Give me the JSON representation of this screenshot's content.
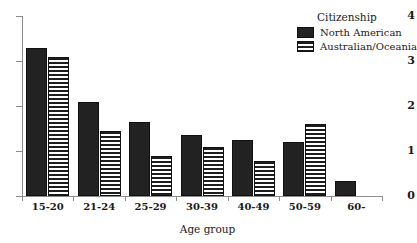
{
  "chart_data": {
    "type": "bar",
    "title": "",
    "xlabel": "Age group",
    "ylabel": "",
    "categories": [
      "15-20",
      "21-24",
      "25-29",
      "30-39",
      "40-49",
      "50-59",
      "60-"
    ],
    "series": [
      {
        "name": "North American",
        "pattern": "solid",
        "color": "#222222",
        "values": [
          3.3,
          2.1,
          1.65,
          1.35,
          1.25,
          1.2,
          0.33
        ]
      },
      {
        "name": "Australian/Oceania",
        "pattern": "horizontal-stripes",
        "color": "#1d1d1d",
        "values": [
          3.1,
          1.45,
          0.9,
          1.1,
          0.78,
          1.6,
          0
        ]
      }
    ],
    "ylim": [
      0,
      4
    ],
    "yticks": [
      0,
      1,
      2,
      3,
      4
    ],
    "ytick_labels": [
      "0",
      "1",
      "2",
      "3",
      "4"
    ],
    "grid": false,
    "legend_position": "top-right",
    "legend_title": "Citizenship"
  },
  "axis": {
    "x_title": "Age group",
    "tick_labels_y": [
      "0",
      "1",
      "2",
      "3",
      "4"
    ],
    "tick_labels_x": [
      "15-20",
      "21-24",
      "25-29",
      "30-39",
      "40-49",
      "50-59",
      "60-"
    ]
  },
  "legend": {
    "title": "Citizenship",
    "entries": [
      {
        "label": "North American"
      },
      {
        "label": "Australian/Oceania"
      }
    ]
  }
}
